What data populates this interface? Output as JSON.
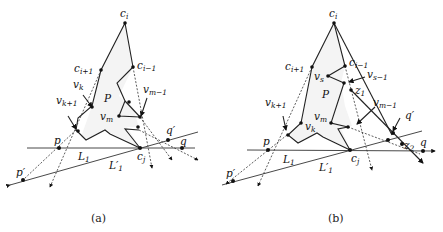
{
  "figure": {
    "panels": [
      {
        "id": "a",
        "caption": "(a)",
        "labels": {
          "c_i": {
            "base": "c",
            "sub": "i"
          },
          "c_i1": {
            "base": "c",
            "sub": "i+1"
          },
          "c_im1": {
            "base": "c",
            "sub": "i−1"
          },
          "v_k": {
            "base": "v",
            "sub": "k"
          },
          "v_k1": {
            "base": "v",
            "sub": "k+1"
          },
          "v_m": {
            "base": "v",
            "sub": "m"
          },
          "v_mm1": {
            "base": "v",
            "sub": "m−1"
          },
          "P": {
            "base": "P"
          },
          "p": {
            "base": "p"
          },
          "p_prime": {
            "base": "p′"
          },
          "q": {
            "base": "q"
          },
          "q_prime": {
            "base": "q′"
          },
          "c_j": {
            "base": "c",
            "sub": "j"
          },
          "L1": {
            "base": "L",
            "sub": "1"
          },
          "L1_prime": {
            "base": "L′",
            "sub": "1"
          }
        }
      },
      {
        "id": "b",
        "caption": "(b)",
        "labels": {
          "c_i": {
            "base": "c",
            "sub": "i"
          },
          "c_i1": {
            "base": "c",
            "sub": "i+1"
          },
          "c_im1": {
            "base": "c",
            "sub": "i−1"
          },
          "v_s": {
            "base": "v",
            "sub": "s"
          },
          "v_sm1": {
            "base": "v",
            "sub": "s−1"
          },
          "z1": {
            "base": "z",
            "sub": "1"
          },
          "z2": {
            "base": "z",
            "sub": "2"
          },
          "v_k": {
            "base": "v",
            "sub": "k"
          },
          "v_k1": {
            "base": "v",
            "sub": "k+1"
          },
          "v_m": {
            "base": "v",
            "sub": "m"
          },
          "v_mm1": {
            "base": "v",
            "sub": "m−1"
          },
          "P": {
            "base": "P"
          },
          "p": {
            "base": "p"
          },
          "p_prime": {
            "base": "p′"
          },
          "q": {
            "base": "q"
          },
          "q_prime": {
            "base": "q′"
          },
          "c_j": {
            "base": "c",
            "sub": "j"
          },
          "L1": {
            "base": "L",
            "sub": "1"
          },
          "L1_prime": {
            "base": "L′",
            "sub": "1"
          }
        }
      }
    ]
  }
}
